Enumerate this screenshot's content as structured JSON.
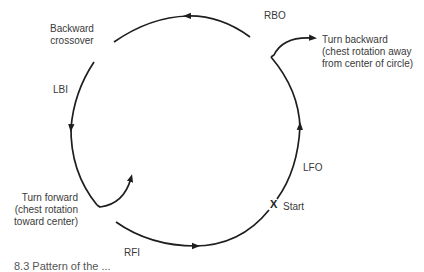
{
  "diagram": {
    "stroke_color": "#1e1e1e",
    "text_color": "#3a3a3a",
    "labels": {
      "backward_crossover": "Backward\ncrossover",
      "rbo": "RBO",
      "turn_backward": "Turn backward\n(chest rotation away\nfrom center of circle)",
      "lbi": "LBI",
      "lfo": "LFO",
      "turn_forward": "Turn forward\n(chest rotation\ntoward center)",
      "start_marker": "X",
      "start": "Start",
      "rfi": "RFI"
    },
    "segments": [
      {
        "name": "RBO",
        "direction": "counterclockwise-left",
        "position": "top"
      },
      {
        "name": "LBI",
        "direction": "down",
        "position": "left"
      },
      {
        "name": "RFI",
        "direction": "right",
        "position": "bottom"
      },
      {
        "name": "LFO",
        "direction": "up",
        "position": "right"
      }
    ],
    "caption": "8.3   Pattern of the ..."
  }
}
